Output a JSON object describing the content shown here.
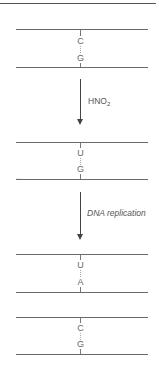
{
  "diagram": {
    "pairs": [
      {
        "top_base": "C",
        "bottom_base": "G"
      },
      {
        "top_base": "U",
        "bottom_base": "G"
      },
      {
        "top_base": "U",
        "bottom_base": "A"
      },
      {
        "top_base": "C",
        "bottom_base": "G"
      }
    ],
    "steps": [
      {
        "label_main": "HNO",
        "label_sub": "2",
        "italic": false
      },
      {
        "label_main": "DNA replication",
        "label_sub": "",
        "italic": true
      }
    ],
    "colors": {
      "strand": "#6a6a6a",
      "arrow": "#444444",
      "text": "#555555"
    }
  }
}
